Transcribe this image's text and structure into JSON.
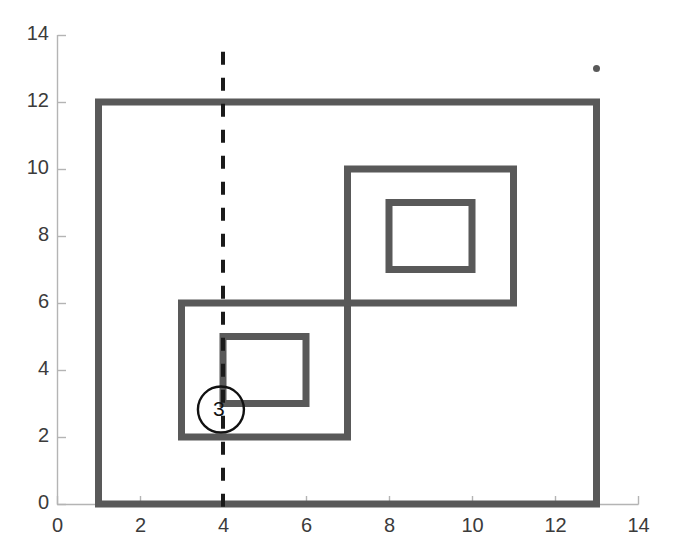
{
  "chart_data": {
    "type": "line",
    "title": "",
    "xlabel": "",
    "ylabel": "",
    "xlim": [
      0,
      14
    ],
    "ylim": [
      0,
      14
    ],
    "grid": false,
    "legend": "none",
    "x_ticks": [
      0,
      2,
      4,
      6,
      8,
      10,
      12,
      14
    ],
    "y_ticks": [
      0,
      2,
      4,
      6,
      8,
      10,
      12,
      14
    ],
    "x_tick_labels": [
      "0",
      "2",
      "4",
      "6",
      "8",
      "10",
      "12",
      "14"
    ],
    "y_tick_labels": [
      "0",
      "2",
      "4",
      "6",
      "8",
      "10",
      "12",
      "14"
    ],
    "series": [
      {
        "name": "outer-boundary",
        "type": "closed-polyline",
        "style": "solid",
        "color": "#595959",
        "linewidth": 7,
        "points": [
          [
            1,
            0
          ],
          [
            1,
            12
          ],
          [
            13,
            12
          ],
          [
            13,
            0
          ],
          [
            1,
            0
          ]
        ]
      },
      {
        "name": "lower-left-outer-square",
        "type": "closed-polyline",
        "style": "solid",
        "color": "#595959",
        "linewidth": 7,
        "points": [
          [
            3,
            2
          ],
          [
            3,
            6
          ],
          [
            7,
            6
          ],
          [
            7,
            2
          ],
          [
            3,
            2
          ]
        ]
      },
      {
        "name": "lower-left-inner-square",
        "type": "closed-polyline",
        "style": "solid",
        "color": "#595959",
        "linewidth": 7,
        "points": [
          [
            4,
            3
          ],
          [
            4,
            5
          ],
          [
            6,
            5
          ],
          [
            6,
            3
          ],
          [
            4,
            3
          ]
        ]
      },
      {
        "name": "upper-right-outer-square",
        "type": "closed-polyline",
        "style": "solid",
        "color": "#595959",
        "linewidth": 7,
        "points": [
          [
            7,
            6
          ],
          [
            7,
            10
          ],
          [
            11,
            10
          ],
          [
            11,
            6
          ],
          [
            7,
            6
          ]
        ]
      },
      {
        "name": "upper-right-inner-square",
        "type": "closed-polyline",
        "style": "solid",
        "color": "#595959",
        "linewidth": 7,
        "points": [
          [
            8,
            7
          ],
          [
            8,
            9
          ],
          [
            10,
            9
          ],
          [
            10,
            7
          ],
          [
            8,
            7
          ]
        ]
      },
      {
        "name": "vertical-dashed-line",
        "type": "polyline",
        "style": "dashed",
        "color": "#1a1a1a",
        "linewidth": 4,
        "points": [
          [
            4,
            13.5
          ],
          [
            4,
            -0.2
          ]
        ]
      }
    ],
    "points": [
      {
        "name": "isolated-marker",
        "x": 13,
        "y": 13,
        "marker": "dot",
        "color": "#595959",
        "size": 7
      }
    ],
    "annotations": [
      {
        "name": "circled-three",
        "label": "3",
        "x": 3.95,
        "y": 2.82,
        "shape": "circle",
        "radius_px": 23,
        "color": "#111111"
      }
    ]
  },
  "axes": {
    "axis_color": "#b4b4b4",
    "tick_color": "#b4b4b4",
    "label_color": "#3b3b3b",
    "plot_left_px": 57,
    "plot_right_px": 638,
    "plot_bottom_px": 504,
    "plot_top_px": 35
  }
}
